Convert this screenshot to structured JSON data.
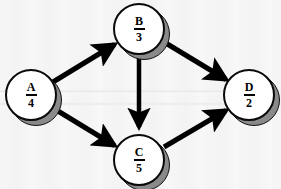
{
  "diagram": {
    "type": "directed-graph",
    "canvas": {
      "width": 281,
      "height": 189
    },
    "style": {
      "background_color": "#f4f4f4",
      "node_fill": "#ffffff",
      "node_stroke": "#0a0a0a",
      "node_shadow": "#8a8a8a",
      "edge_color": "#000000",
      "label_color": "#000000"
    },
    "nodes": [
      {
        "id": "A",
        "name": "A",
        "numerator": "A",
        "denominator": "4",
        "value": 4,
        "cx": 31,
        "cy": 95,
        "r": 26
      },
      {
        "id": "B",
        "name": "B",
        "numerator": "B",
        "denominator": "3",
        "value": 3,
        "cx": 139,
        "cy": 29,
        "r": 26
      },
      {
        "id": "C",
        "name": "C",
        "numerator": "C",
        "denominator": "5",
        "value": 5,
        "cx": 139,
        "cy": 160,
        "r": 26
      },
      {
        "id": "D",
        "name": "D",
        "numerator": "D",
        "denominator": "2",
        "value": 2,
        "cx": 249,
        "cy": 95,
        "r": 26
      }
    ],
    "edges": [
      {
        "id": "A-B",
        "from": "A",
        "to": "B",
        "directed": true,
        "label": ""
      },
      {
        "id": "A-C",
        "from": "A",
        "to": "C",
        "directed": true,
        "label": ""
      },
      {
        "id": "B-C",
        "from": "B",
        "to": "C",
        "directed": true,
        "label": ""
      },
      {
        "id": "B-D",
        "from": "B",
        "to": "D",
        "directed": true,
        "label": ""
      },
      {
        "id": "C-D",
        "from": "C",
        "to": "D",
        "directed": true,
        "label": ""
      }
    ]
  }
}
